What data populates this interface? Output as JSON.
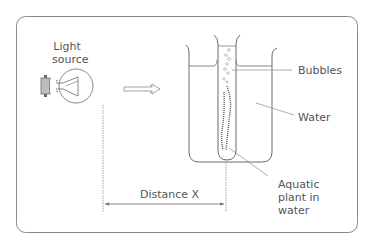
{
  "labels": {
    "light_source": [
      "Light",
      "source"
    ],
    "bubbles": "Bubbles",
    "water": "Water",
    "distance": "Distance X",
    "aquatic_plant": [
      "Aquatic",
      "plant in",
      "water"
    ]
  },
  "colors": {
    "line": "#6b6b6b",
    "text": "#555555",
    "frame": "#8a8a8a",
    "bulb_base": "#bdbdbd"
  }
}
